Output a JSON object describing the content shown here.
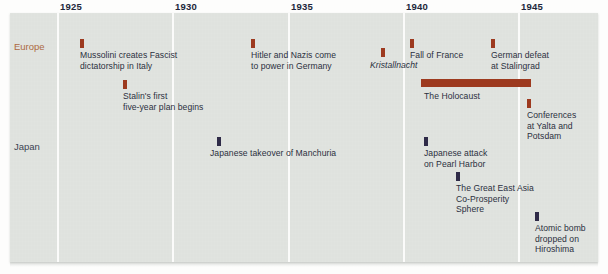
{
  "figure": {
    "type": "timeline",
    "background_color": "#dfe2de",
    "gridline_color": "#fbfbfa",
    "axis_years": [
      {
        "label": "1925",
        "x": 57
      },
      {
        "label": "1930",
        "x": 172
      },
      {
        "label": "1935",
        "x": 288
      },
      {
        "label": "1940",
        "x": 403
      },
      {
        "label": "1945",
        "x": 518
      }
    ],
    "rows": [
      {
        "name": "Europe",
        "label": "Europe",
        "color": "#ad6a42",
        "marker_color": "#9d3a1f",
        "y": 41
      },
      {
        "name": "Japan",
        "label": "Japan",
        "color": "#3c4352",
        "marker_color": "#2f2b48",
        "y": 141
      }
    ],
    "events": [
      {
        "id": "mussolini",
        "row": "Europe",
        "text": "Mussolini creates Fascist\ndictatorship in Italy",
        "marker_x": 80,
        "marker_y": 39,
        "text_x": 80,
        "text_y": 50,
        "italic": false,
        "kind": "point"
      },
      {
        "id": "stalin-five-year-plan",
        "row": "Europe",
        "text": "Stalin's first\nfive-year plan begins",
        "marker_x": 123,
        "marker_y": 80,
        "text_x": 123,
        "text_y": 91,
        "italic": false,
        "kind": "point"
      },
      {
        "id": "hitler-nazis-power",
        "row": "Europe",
        "text": "Hitler and Nazis come\nto power in Germany",
        "marker_x": 251,
        "marker_y": 39,
        "text_x": 251,
        "text_y": 50,
        "italic": false,
        "kind": "point"
      },
      {
        "id": "kristallnacht",
        "row": "Europe",
        "text": "Kristallnacht",
        "marker_x": 381,
        "marker_y": 48,
        "text_x": 370,
        "text_y": 60,
        "italic": true,
        "kind": "point"
      },
      {
        "id": "fall-of-france",
        "row": "Europe",
        "text": "Fall of France",
        "marker_x": 410,
        "marker_y": 39,
        "text_x": 410,
        "text_y": 50,
        "italic": false,
        "kind": "point"
      },
      {
        "id": "german-defeat-stalingrad",
        "row": "Europe",
        "text": "German defeat\nat Stalingrad",
        "marker_x": 491,
        "marker_y": 39,
        "text_x": 491,
        "text_y": 50,
        "italic": false,
        "kind": "point"
      },
      {
        "id": "the-holocaust",
        "row": "Europe",
        "text": "The Holocaust",
        "span_x": 421,
        "span_y": 79,
        "span_width": 110,
        "text_x": 424,
        "text_y": 91,
        "italic": false,
        "kind": "span"
      },
      {
        "id": "conferences-yalta-potsdam",
        "row": "Europe",
        "text": "Conferences\nat Yalta and\nPotsdam",
        "marker_x": 527,
        "marker_y": 99,
        "text_x": 527,
        "text_y": 110,
        "italic": false,
        "kind": "point"
      },
      {
        "id": "japanese-takeover-manchuria",
        "row": "Japan",
        "text": "Japanese takeover of Manchuria",
        "marker_x": 217,
        "marker_y": 137,
        "text_x": 210,
        "text_y": 148,
        "italic": false,
        "kind": "point"
      },
      {
        "id": "pearl-harbor",
        "row": "Japan",
        "text": "Japanese attack\non Pearl Harbor",
        "marker_x": 424,
        "marker_y": 137,
        "text_x": 424,
        "text_y": 148,
        "italic": false,
        "kind": "point"
      },
      {
        "id": "greater-east-asia-co-prosperity-sphere",
        "row": "Japan",
        "text": "The Great East Asia\nCo-Prosperity\nSphere",
        "marker_x": 456,
        "marker_y": 172,
        "text_x": 456,
        "text_y": 183,
        "italic": false,
        "kind": "point"
      },
      {
        "id": "atomic-bomb-hiroshima",
        "row": "Japan",
        "text": "Atomic bomb\ndropped on\nHiroshima",
        "marker_x": 535,
        "marker_y": 212,
        "text_x": 535,
        "text_y": 223,
        "italic": false,
        "kind": "point"
      }
    ]
  },
  "chart_data": {
    "type": "timeline",
    "title": "",
    "xlabel": "",
    "ylabel": "",
    "xlim": [
      1922.6,
      1948.1
    ],
    "x_ticks": [
      1925,
      1930,
      1935,
      1940,
      1945
    ],
    "x_tick_labels": [
      "1925",
      "1930",
      "1935",
      "1940",
      "1945"
    ],
    "grid": "vertical-only",
    "legend": "none",
    "categories": [
      "Europe",
      "Japan"
    ],
    "series": [
      {
        "name": "Europe",
        "color": "#9d3a1f",
        "events": [
          {
            "year": 1926,
            "label": "Mussolini creates Fascist dictatorship in Italy",
            "kind": "point"
          },
          {
            "year": 1928,
            "label": "Stalin's first five-year plan begins",
            "kind": "point"
          },
          {
            "year": 1933,
            "label": "Hitler and Nazis come to power in Germany",
            "kind": "point"
          },
          {
            "year": 1938,
            "label": "Kristallnacht",
            "kind": "point"
          },
          {
            "year": 1940,
            "label": "Fall of France",
            "kind": "point"
          },
          {
            "year": 1943,
            "label": "German defeat at Stalingrad",
            "kind": "point"
          },
          {
            "year_start": 1941,
            "year_end": 1945,
            "label": "The Holocaust",
            "kind": "span"
          },
          {
            "year": 1945,
            "label": "Conferences at Yalta and Potsdam",
            "kind": "point"
          }
        ]
      },
      {
        "name": "Japan",
        "color": "#2f2b48",
        "events": [
          {
            "year": 1931,
            "label": "Japanese takeover of Manchuria",
            "kind": "point"
          },
          {
            "year": 1941,
            "label": "Japanese attack on Pearl Harbor",
            "kind": "point"
          },
          {
            "year": 1942,
            "label": "The Great East Asia Co-Prosperity Sphere",
            "kind": "point"
          },
          {
            "year": 1945,
            "label": "Atomic bomb dropped on Hiroshima",
            "kind": "point"
          }
        ]
      }
    ]
  }
}
